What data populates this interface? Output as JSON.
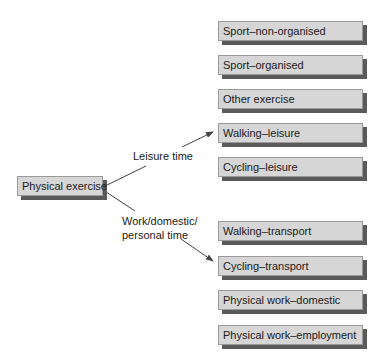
{
  "diagram": {
    "root": {
      "label": "Physical exercise"
    },
    "branches": [
      {
        "label": "Leisure time",
        "children": [
          "Sport–non-organised",
          "Sport–organised",
          "Other exercise",
          "Walking–leisure",
          "Cycling–leisure"
        ]
      },
      {
        "label_line1": "Work/domestic/",
        "label_line2": "personal time",
        "children": [
          "Walking–transport",
          "Cycling–transport",
          "Physical work–domestic",
          "Physical work–employment"
        ]
      }
    ]
  },
  "colors": {
    "box_fill": "#d6d6d6",
    "box_border": "#9a9a9a",
    "shadow": "#5a5a5a",
    "line": "#444444"
  }
}
